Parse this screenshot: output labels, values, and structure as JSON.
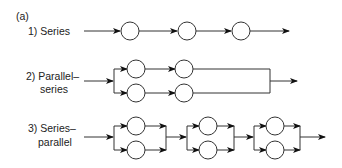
{
  "figure": {
    "panel_label": "(a)",
    "rows": [
      {
        "label_line1": "1) Series",
        "label_line2": ""
      },
      {
        "label_line1": "2) Parallel–",
        "label_line2": "series"
      },
      {
        "label_line1": "3) Series–",
        "label_line2": "parallel"
      }
    ],
    "colors": {
      "stroke": "#333333",
      "text": "#222222"
    }
  }
}
